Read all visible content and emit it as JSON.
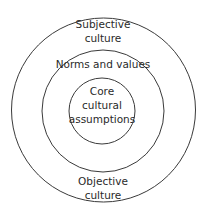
{
  "diagram": {
    "type": "concentric-circles",
    "layers": [
      {
        "id": "outer",
        "label_top": [
          "Subjective",
          "culture"
        ],
        "label_bottom": [
          "Objective",
          "culture"
        ]
      },
      {
        "id": "middle",
        "label": "Norms and values"
      },
      {
        "id": "inner",
        "label": [
          "Core",
          "cultural",
          "assumptions"
        ]
      }
    ],
    "stroke_color": "#3a3a3a",
    "background": "#ffffff"
  }
}
